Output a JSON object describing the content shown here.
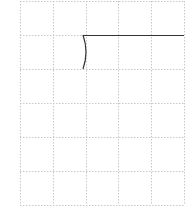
{
  "diagram": {
    "background": "#ffffff",
    "grid": {
      "color": "#c8c8c8",
      "dash": "1.5,1.5",
      "x_lines": [
        20,
        53,
        86,
        118,
        151,
        184
      ],
      "y_lines": [
        1,
        35,
        69,
        103,
        137,
        171,
        205
      ],
      "columns": 5,
      "rows": 6
    },
    "strokes": {
      "color": "#333333",
      "horizontal_line": {
        "x1": 83,
        "y1": 35,
        "x2": 184,
        "y2": 35
      },
      "curve": {
        "path": "M83 35 Q89 52 83 69"
      }
    }
  }
}
